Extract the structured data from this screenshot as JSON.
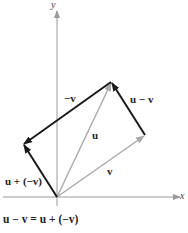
{
  "diagram": {
    "axes": {
      "x_label": "x",
      "y_label": "y"
    },
    "vectors": [
      {
        "name": "u",
        "label": "u",
        "color": "#a9a9a9",
        "from": [
          0,
          0
        ],
        "to": [
          54,
          115
        ]
      },
      {
        "name": "v",
        "label": "v",
        "color": "#a9a9a9",
        "from": [
          0,
          0
        ],
        "to": [
          88,
          62
        ]
      },
      {
        "name": "neg-v",
        "label": "−v",
        "color": "#1a1a1a",
        "from": [
          54,
          115
        ],
        "to": [
          -34,
          53
        ]
      },
      {
        "name": "u-minus-v",
        "label": "u − v",
        "color": "#1a1a1a",
        "from": [
          88,
          62
        ],
        "to": [
          54,
          115
        ]
      },
      {
        "name": "u-plus-neg-v",
        "label": "u + (−v)",
        "color": "#1a1a1a",
        "from": [
          0,
          0
        ],
        "to": [
          -34,
          53
        ]
      }
    ],
    "equation": "u − v = u + (−v)",
    "colors": {
      "axis": "#9a9a9a",
      "light_vector": "#a9a9a9",
      "dark_vector": "#1a1a1a"
    }
  }
}
